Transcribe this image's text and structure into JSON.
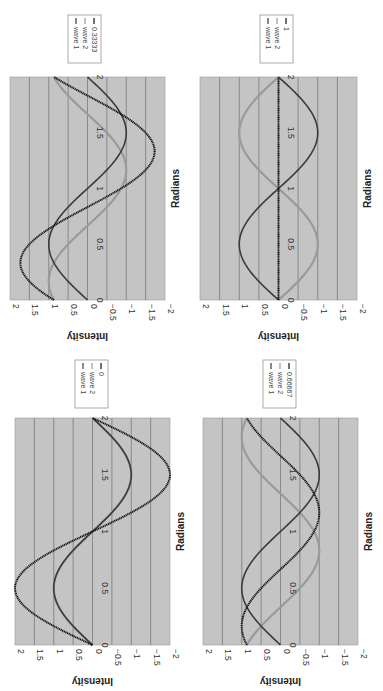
{
  "page": {
    "x_label": "Radians",
    "y_label": "Intensity"
  },
  "chart_data": [
    {
      "type": "line",
      "panel": "top-left",
      "title": "",
      "xlabel": "Radians",
      "ylabel": "Intensity",
      "xlim": [
        0,
        2
      ],
      "ylim": [
        -2,
        2
      ],
      "x_ticks": [
        "0",
        "0.5",
        "1",
        "1.5",
        "2"
      ],
      "y_ticks": [
        "2",
        "1.5",
        "1",
        "0.5",
        "0",
        "-0.5",
        "-1",
        "-1.5",
        "-2"
      ],
      "grid": true,
      "legend": [
        "wave 1",
        "wave 2",
        "0.33333"
      ],
      "phase_fraction": 0.33333,
      "series": [
        {
          "name": "wave 1",
          "formula": "sin(pi*x)",
          "color": "#3a3a3a"
        },
        {
          "name": "wave 2",
          "formula": "sin(pi*x + 0.33333*pi)",
          "color": "#9a9a9a"
        },
        {
          "name": "0.33333",
          "formula": "wave1 + wave2",
          "color": "#111111"
        }
      ]
    },
    {
      "type": "line",
      "panel": "top-right",
      "xlabel": "Radians",
      "ylabel": "Intensity",
      "xlim": [
        0,
        2
      ],
      "ylim": [
        -2,
        2
      ],
      "x_ticks": [
        "0",
        "0.5",
        "1",
        "1.5",
        "2"
      ],
      "y_ticks": [
        "2",
        "1.5",
        "1",
        "0.5",
        "0",
        "-0.5",
        "-1",
        "-1.5",
        "-2"
      ],
      "grid": true,
      "legend": [
        "wave 1",
        "wave 2",
        "1"
      ],
      "phase_fraction": 1,
      "series": [
        {
          "name": "wave 1",
          "formula": "sin(pi*x)",
          "color": "#3a3a3a"
        },
        {
          "name": "wave 2",
          "formula": "sin(pi*x + pi)",
          "color": "#9a9a9a"
        },
        {
          "name": "1",
          "formula": "wave1 + wave2",
          "color": "#111111"
        }
      ]
    },
    {
      "type": "line",
      "panel": "bottom-left",
      "xlabel": "Radians",
      "ylabel": "Intensity",
      "xlim": [
        0,
        2
      ],
      "ylim": [
        -2,
        2
      ],
      "x_ticks": [
        "0",
        "0.5",
        "1",
        "1.5",
        "2"
      ],
      "y_ticks": [
        "2",
        "1.5",
        "1",
        "0.5",
        "0",
        "-0.5",
        "-1",
        "-1.5",
        "-2"
      ],
      "grid": true,
      "legend": [
        "wave 1",
        "wave 2",
        "0"
      ],
      "phase_fraction": 0,
      "series": [
        {
          "name": "wave 1",
          "formula": "sin(pi*x)",
          "color": "#3a3a3a"
        },
        {
          "name": "wave 2",
          "formula": "sin(pi*x)",
          "color": "#9a9a9a"
        },
        {
          "name": "0",
          "formula": "wave1 + wave2",
          "color": "#111111"
        }
      ]
    },
    {
      "type": "line",
      "panel": "bottom-right",
      "xlabel": "Radians",
      "ylabel": "Intensity",
      "xlim": [
        0,
        2
      ],
      "ylim": [
        -2,
        2
      ],
      "x_ticks": [
        "0",
        "0.5",
        "1",
        "1.5",
        "2"
      ],
      "y_ticks": [
        "2",
        "1.5",
        "1",
        "0.5",
        "0",
        "-0.5",
        "-1",
        "-1.5",
        "-2"
      ],
      "grid": true,
      "legend": [
        "wave 1",
        "wave 2",
        "0.66667"
      ],
      "phase_fraction": 0.66667,
      "series": [
        {
          "name": "wave 1",
          "formula": "sin(pi*x)",
          "color": "#3a3a3a"
        },
        {
          "name": "wave 2",
          "formula": "sin(pi*x + 0.66667*pi)",
          "color": "#9a9a9a"
        },
        {
          "name": "0.66667",
          "formula": "wave1 + wave2",
          "color": "#111111"
        }
      ]
    }
  ],
  "layout": {
    "panels": [
      {
        "plot": {
          "x": 10,
          "y": 77,
          "w": 155,
          "h": 223
        },
        "legend": {
          "x": 68,
          "y": 15
        }
      },
      {
        "plot": {
          "x": 200,
          "y": 77,
          "w": 157,
          "h": 223
        },
        "legend": {
          "x": 260,
          "y": 15
        }
      },
      {
        "plot": {
          "x": 15,
          "y": 418,
          "w": 155,
          "h": 227
        },
        "legend": {
          "x": 75,
          "y": 360
        }
      },
      {
        "plot": {
          "x": 203,
          "y": 418,
          "w": 155,
          "h": 227
        },
        "legend": {
          "x": 263,
          "y": 360
        }
      }
    ],
    "plot_bg": "#c4c4c4",
    "grid_color": "#7a7a7a"
  }
}
